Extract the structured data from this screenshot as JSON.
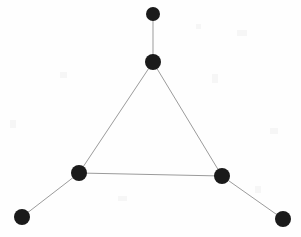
{
  "figure": {
    "kind": "node-link-graph",
    "title": "",
    "background_color": "#fefefe",
    "width": 301,
    "height": 237
  },
  "style": {
    "node_color": "#1a1a1a",
    "edge_color": "#9b9b9b",
    "edge_width": 1,
    "node_radius": 8
  },
  "graph_data": {
    "type": "graph",
    "directed": false,
    "node_count": 6,
    "edge_count": 5,
    "nodes": [
      {
        "id": "n1",
        "label": "",
        "x": 153,
        "y": 14,
        "r": 7,
        "role": "pendant-top",
        "degree": 1
      },
      {
        "id": "n2",
        "label": "",
        "x": 153,
        "y": 62,
        "r": 8,
        "role": "apex",
        "degree": 3
      },
      {
        "id": "n3",
        "label": "",
        "x": 79,
        "y": 173,
        "r": 8,
        "role": "left-vertex",
        "degree": 3
      },
      {
        "id": "n4",
        "label": "",
        "x": 222,
        "y": 176,
        "r": 8,
        "role": "right-vertex",
        "degree": 3
      },
      {
        "id": "n5",
        "label": "",
        "x": 22,
        "y": 217,
        "r": 8,
        "role": "pendant-bottom-left",
        "degree": 1
      },
      {
        "id": "n6",
        "label": "",
        "x": 283,
        "y": 219,
        "r": 8,
        "role": "pendant-bottom-right",
        "degree": 1
      }
    ],
    "edges": [
      {
        "id": "e1",
        "source": "n1",
        "target": "n2",
        "x1": 153,
        "y1": 14,
        "x2": 153,
        "y2": 62
      },
      {
        "id": "e2",
        "source": "n2",
        "target": "n3",
        "x1": 153,
        "y1": 62,
        "x2": 79,
        "y2": 173
      },
      {
        "id": "e3",
        "source": "n2",
        "target": "n4",
        "x1": 153,
        "y1": 62,
        "x2": 222,
        "y2": 176
      },
      {
        "id": "e4",
        "source": "n3",
        "target": "n4",
        "x1": 79,
        "y1": 173,
        "x2": 222,
        "y2": 176
      },
      {
        "id": "e5",
        "source": "n3",
        "target": "n5",
        "x1": 79,
        "y1": 173,
        "x2": 22,
        "y2": 217
      },
      {
        "id": "e6",
        "source": "n4",
        "target": "n6",
        "x1": 222,
        "y1": 176,
        "x2": 283,
        "y2": 219
      }
    ]
  }
}
